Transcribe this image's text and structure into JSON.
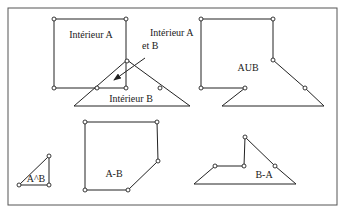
{
  "colors": {
    "stroke": "#222222",
    "frame": "#555555",
    "background": "#ffffff",
    "vertex_fill": "#ffffff"
  },
  "frame": {
    "x": 8,
    "y": 8,
    "width": 329,
    "height": 197
  },
  "shapes": {
    "square_a": {
      "label": "Intérieur A",
      "label_pos": [
        91,
        38
      ],
      "points": [
        [
          54,
          19
        ],
        [
          126,
          19
        ],
        [
          126,
          88
        ],
        [
          54,
          88
        ]
      ],
      "vertices": [
        [
          54,
          19
        ],
        [
          126,
          19
        ],
        [
          126,
          88
        ],
        [
          54,
          88
        ]
      ]
    },
    "triangle_b": {
      "label": "Intérieur B",
      "label_pos": [
        131,
        102
      ],
      "points": [
        [
          74,
          106
        ],
        [
          127,
          60
        ],
        [
          190,
          106
        ]
      ],
      "vertices": [
        [
          127,
          61
        ],
        [
          97,
          88
        ],
        [
          160,
          88
        ]
      ]
    },
    "intersection_callout": {
      "label_line1": "Intérieur A",
      "label_line2": "et B",
      "label_pos1": [
        150,
        36
      ],
      "label_pos2": [
        142,
        49
      ],
      "arrow_from": [
        145,
        58
      ],
      "arrow_to": [
        114,
        80
      ]
    },
    "union": {
      "label": "AUB",
      "label_pos": [
        248,
        71
      ],
      "points": [
        [
          201,
          19
        ],
        [
          273,
          19
        ],
        [
          273,
          60
        ],
        [
          305,
          88
        ],
        [
          324,
          106
        ],
        [
          222,
          106
        ],
        [
          245,
          88
        ],
        [
          201,
          88
        ]
      ],
      "vertices": [
        [
          201,
          19
        ],
        [
          273,
          19
        ],
        [
          273,
          60
        ],
        [
          305,
          88
        ],
        [
          245,
          88
        ],
        [
          201,
          88
        ]
      ]
    },
    "a_and_b": {
      "label": "A^B",
      "label_pos": [
        36,
        182
      ],
      "points": [
        [
          19,
          185
        ],
        [
          49,
          156
        ],
        [
          49,
          185
        ]
      ],
      "vertices": [
        [
          19,
          185
        ],
        [
          49,
          156
        ],
        [
          49,
          185
        ]
      ]
    },
    "a_minus_b": {
      "label": "A-B",
      "label_pos": [
        114,
        177
      ],
      "points": [
        [
          85,
          122
        ],
        [
          157,
          122
        ],
        [
          158,
          161
        ],
        [
          128,
          190
        ],
        [
          85,
          190
        ]
      ],
      "vertices": [
        [
          85,
          122
        ],
        [
          157,
          122
        ],
        [
          158,
          161
        ],
        [
          128,
          190
        ],
        [
          85,
          190
        ]
      ]
    },
    "b_minus_a": {
      "label": "B-A",
      "label_pos": [
        264,
        178
      ],
      "points": [
        [
          194,
          184
        ],
        [
          215,
          166
        ],
        [
          244,
          166
        ],
        [
          245,
          137
        ],
        [
          275,
          166
        ],
        [
          296,
          184
        ]
      ],
      "vertices": [
        [
          215,
          166
        ],
        [
          244,
          166
        ],
        [
          245,
          137
        ],
        [
          275,
          166
        ]
      ]
    }
  }
}
